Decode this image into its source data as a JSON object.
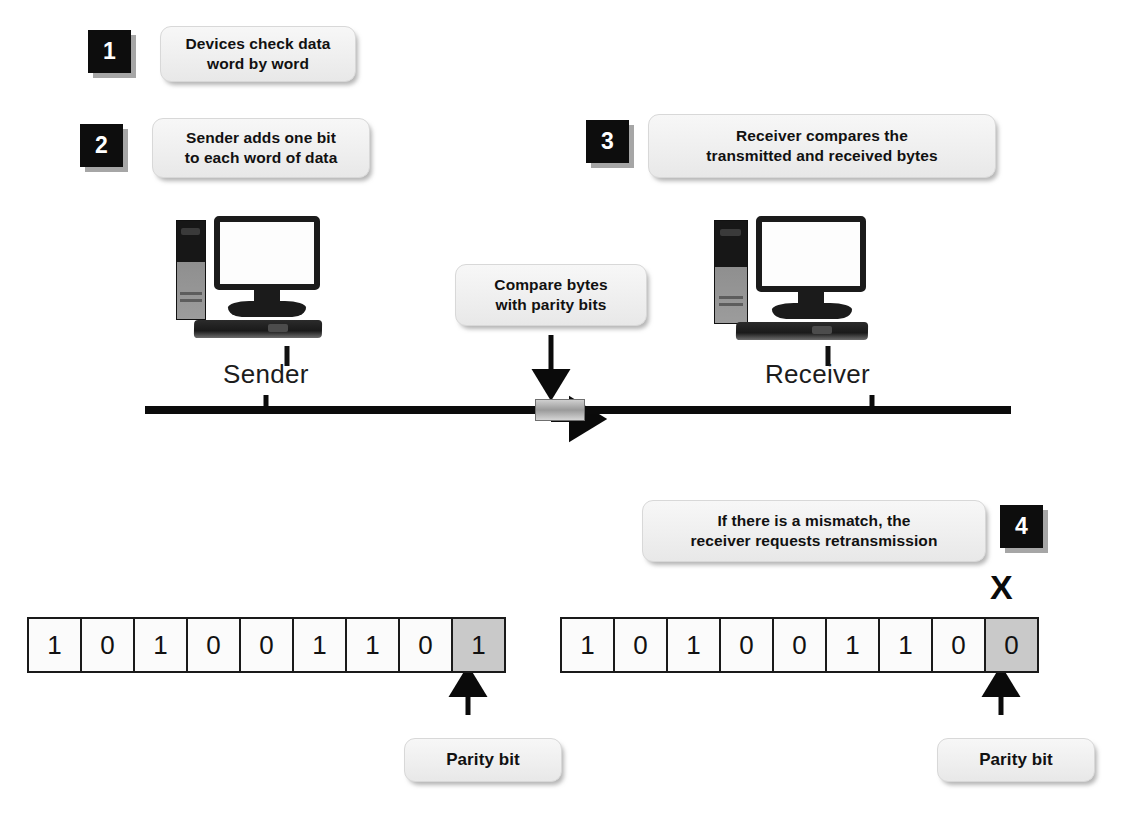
{
  "diagram": {
    "accent_dark": "#0d0d0d",
    "callout_bg": "#f2f2f2",
    "parity_cell_bg": "#c9c9c9"
  },
  "steps": [
    {
      "number": "1",
      "text_line1": "Devices check data",
      "text_line2": "word by word"
    },
    {
      "number": "2",
      "text_line1": "Sender adds one bit",
      "text_line2": "to each word of data"
    },
    {
      "number": "3",
      "text_line1": "Receiver compares the",
      "text_line2": "transmitted and received bytes"
    },
    {
      "number": "4",
      "text_line1": "If there is a mismatch, the",
      "text_line2": "receiver requests retransmission"
    }
  ],
  "middle_callout": {
    "text_line1": "Compare bytes",
    "text_line2": "with parity bits"
  },
  "devices": {
    "sender_label": "Sender",
    "receiver_label": "Receiver"
  },
  "bit_rows": [
    {
      "name": "sender-byte",
      "data_bits": [
        "1",
        "0",
        "1",
        "0",
        "0",
        "1",
        "1",
        "0"
      ],
      "parity_bit": "1",
      "parity_label": "Parity bit",
      "mismatch_mark": ""
    },
    {
      "name": "receiver-byte",
      "data_bits": [
        "1",
        "0",
        "1",
        "0",
        "0",
        "1",
        "1",
        "0"
      ],
      "parity_bit": "0",
      "parity_label": "Parity bit",
      "mismatch_mark": "X"
    }
  ]
}
